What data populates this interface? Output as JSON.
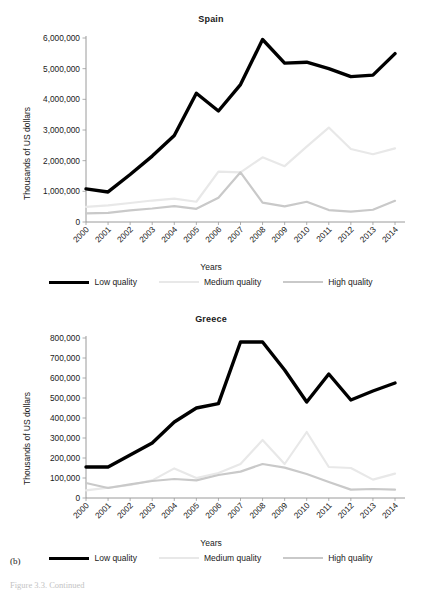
{
  "figure": {
    "caption_label": "(b)",
    "footer_note": "Figure 3.3. Continued"
  },
  "legend": {
    "items": [
      {
        "label": "Low quality",
        "color": "#000000",
        "width": 3.4
      },
      {
        "label": "Medium quality",
        "color": "#e8e8e8",
        "width": 2.2
      },
      {
        "label": "High quality",
        "color": "#c9c9c9",
        "width": 2.2
      }
    ]
  },
  "chart_data": [
    {
      "type": "line",
      "title": "Spain",
      "xlabel": "Years",
      "ylabel": "Thousands of US dollars",
      "grid": false,
      "legend_position": "bottom",
      "categories": [
        "2000",
        "2001",
        "2002",
        "2003",
        "2004",
        "2005",
        "2006",
        "2007",
        "2008",
        "2009",
        "2010",
        "2011",
        "2012",
        "2013",
        "2014"
      ],
      "ylim": [
        0,
        6000000
      ],
      "yticks": [
        0,
        1000000,
        2000000,
        3000000,
        4000000,
        5000000,
        6000000
      ],
      "ytick_labels": [
        "0",
        "1,000,000",
        "2,000,000",
        "3,000,000",
        "4,000,000",
        "5,000,000",
        "6,000,000"
      ],
      "series": [
        {
          "name": "Low quality",
          "color": "#000000",
          "width": 3.4,
          "values": [
            1080000,
            980000,
            1550000,
            2150000,
            2820000,
            4200000,
            3620000,
            4480000,
            5950000,
            5180000,
            5210000,
            5000000,
            4740000,
            4790000,
            5490000
          ]
        },
        {
          "name": "Medium quality",
          "color": "#e8e8e8",
          "width": 2.2,
          "values": [
            490000,
            540000,
            620000,
            700000,
            760000,
            660000,
            1640000,
            1620000,
            2110000,
            1820000,
            2460000,
            3080000,
            2380000,
            2210000,
            2400000
          ]
        },
        {
          "name": "High quality",
          "color": "#c9c9c9",
          "width": 2.2,
          "values": [
            280000,
            300000,
            380000,
            440000,
            520000,
            430000,
            790000,
            1620000,
            630000,
            510000,
            660000,
            390000,
            340000,
            400000,
            690000
          ]
        }
      ]
    },
    {
      "type": "line",
      "title": "Greece",
      "xlabel": "Years",
      "ylabel": "Thousands of US dollars",
      "grid": false,
      "legend_position": "bottom",
      "categories": [
        "2000",
        "2001",
        "2002",
        "2003",
        "2004",
        "2005",
        "2006",
        "2007",
        "2008",
        "2009",
        "2010",
        "2011",
        "2012",
        "2013",
        "2014"
      ],
      "ylim": [
        0,
        800000
      ],
      "yticks": [
        0,
        100000,
        200000,
        300000,
        400000,
        500000,
        600000,
        700000,
        800000
      ],
      "ytick_labels": [
        "0",
        "100,000",
        "200,000",
        "300,000",
        "400,000",
        "500,000",
        "600,000",
        "700,000",
        "800,000"
      ],
      "series": [
        {
          "name": "Low quality",
          "color": "#000000",
          "width": 3.4,
          "values": [
            155000,
            155000,
            215000,
            275000,
            380000,
            450000,
            472000,
            780000,
            780000,
            640000,
            480000,
            620000,
            490000,
            535000,
            575000
          ]
        },
        {
          "name": "Medium quality",
          "color": "#e8e8e8",
          "width": 2.2,
          "values": [
            38000,
            52000,
            65000,
            88000,
            148000,
            100000,
            125000,
            170000,
            290000,
            170000,
            330000,
            155000,
            150000,
            92000,
            122000
          ]
        },
        {
          "name": "High quality",
          "color": "#c9c9c9",
          "width": 2.2,
          "values": [
            75000,
            50000,
            68000,
            85000,
            95000,
            88000,
            115000,
            132000,
            170000,
            152000,
            120000,
            80000,
            42000,
            45000,
            42000
          ]
        }
      ]
    }
  ]
}
